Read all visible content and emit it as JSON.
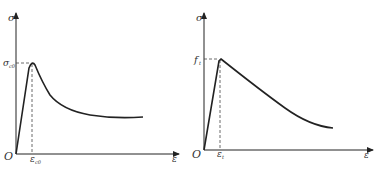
{
  "diagrams": [
    {
      "name": "compression",
      "y_axis_label": "σ",
      "x_axis_label": "ε",
      "origin_label": "O",
      "peak_stress_label": "σ",
      "peak_stress_sub": "c0",
      "peak_strain_label": "ε",
      "peak_strain_sub": "c0",
      "curve_shape": "rise to peak then softening to plateau"
    },
    {
      "name": "tension",
      "y_axis_label": "σ",
      "x_axis_label": "ε",
      "origin_label": "O",
      "peak_stress_label": "f",
      "peak_stress_sub": "t",
      "peak_strain_label": "ε",
      "peak_strain_sub": "t",
      "curve_shape": "rise to peak then gradual decay"
    }
  ],
  "colors": {
    "line": "#222222",
    "text": "#333333",
    "background": "#ffffff"
  }
}
